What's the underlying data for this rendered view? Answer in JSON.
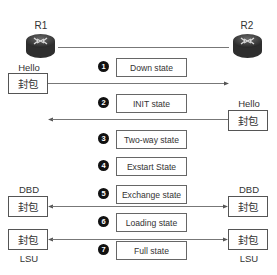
{
  "routers": {
    "left": {
      "label": "R1",
      "icon": "router-icon"
    },
    "right": {
      "label": "R2",
      "icon": "router-icon"
    }
  },
  "packets": {
    "hello_left": {
      "label": "Hello",
      "box": "封包"
    },
    "hello_right": {
      "label": "Hello",
      "box": "封包"
    },
    "dbd_left": {
      "label": "DBD",
      "box": "封包"
    },
    "dbd_right": {
      "label": "DBD",
      "box": "封包"
    },
    "lsu_left": {
      "label": "LSU",
      "box": "封包"
    },
    "lsu_right": {
      "label": "LSU",
      "box": "封包"
    }
  },
  "states": [
    {
      "num": "1",
      "label": "Down state"
    },
    {
      "num": "2",
      "label": "INIT state"
    },
    {
      "num": "3",
      "label": "Two-way state"
    },
    {
      "num": "4",
      "label": "Exstart State"
    },
    {
      "num": "5",
      "label": "Exchange state"
    },
    {
      "num": "6",
      "label": "Loading state"
    },
    {
      "num": "7",
      "label": "Full state"
    }
  ],
  "colors": {
    "line": "#777777",
    "box_border": "#555555",
    "bullet": "#111111",
    "router_body": "#3a3a3a"
  }
}
